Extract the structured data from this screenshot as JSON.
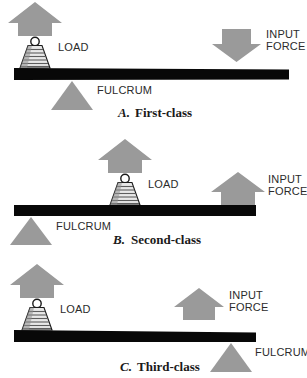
{
  "figure": {
    "colors": {
      "arrow_gray": "#9a9a9a",
      "fulcrum_gray": "#9a9a9a",
      "bar_black": "#080808",
      "weight_gray": "#8f8f8f",
      "label_text": "#2b2b2b",
      "caption_text": "#1a1a1a",
      "background": "#ffffff"
    },
    "labels": {
      "load": "LOAD",
      "fulcrum": "FULCRUM",
      "input_force_line1": "INPUT",
      "input_force_line2": "FORCE"
    },
    "panels": [
      {
        "id": "first-class",
        "caption_letter": "A.",
        "caption_text": "First-class",
        "load_label": "LOAD",
        "fulcrum_label": "FULCRUM",
        "input_force_label_line1": "INPUT",
        "input_force_label_line2": "FORCE",
        "load_arrow_direction": "up",
        "input_force_arrow_direction": "down",
        "load_position": "left",
        "fulcrum_position": "center-left",
        "input_force_position": "right",
        "bar_orientation": "horizontal"
      },
      {
        "id": "second-class",
        "caption_letter": "B.",
        "caption_text": "Second-class",
        "load_label": "LOAD",
        "fulcrum_label": "FULCRUM",
        "input_force_label_line1": "INPUT",
        "input_force_label_line2": "FORCE",
        "load_arrow_direction": "up",
        "input_force_arrow_direction": "up",
        "load_position": "center",
        "fulcrum_position": "left",
        "input_force_position": "right",
        "bar_orientation": "horizontal"
      },
      {
        "id": "third-class",
        "caption_letter": "C.",
        "caption_text": "Third-class",
        "load_label": "LOAD",
        "fulcrum_label": "FULCRUM",
        "input_force_label_line1": "INPUT",
        "input_force_label_line2": "FORCE",
        "load_arrow_direction": "up",
        "input_force_arrow_direction": "up",
        "load_position": "left",
        "fulcrum_position": "right",
        "input_force_position": "center-right",
        "bar_orientation": "horizontal"
      }
    ]
  }
}
